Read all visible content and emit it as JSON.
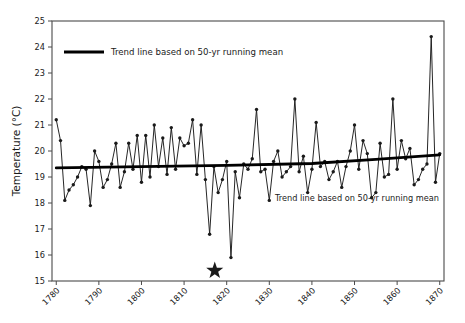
{
  "chart_data": {
    "type": "line",
    "title": "",
    "xlabel": "",
    "ylabel": "Temperature (°C)",
    "xlim": [
      1779,
      1871
    ],
    "ylim": [
      15,
      25
    ],
    "grid": false,
    "xticks": [
      1780,
      1790,
      1800,
      1810,
      1820,
      1830,
      1840,
      1850,
      1860,
      1870
    ],
    "xtick_labels": [
      "1780",
      "1790",
      "1800",
      "1810",
      "1820",
      "1830",
      "1840",
      "1850",
      "1860",
      "1870"
    ],
    "yticks": [
      15,
      16,
      17,
      18,
      19,
      20,
      21,
      22,
      23,
      24,
      25
    ],
    "ytick_labels": [
      "15",
      "16",
      "17",
      "18",
      "19",
      "20",
      "21",
      "22",
      "23",
      "24",
      "25"
    ],
    "legend": {
      "position": "top-left-inside",
      "entries": [
        {
          "label": "Trend line based on 50-yr running mean",
          "color": "#000000",
          "marker": "line"
        }
      ]
    },
    "annotations": [
      {
        "text": "Trend line based on 50-yr running mean",
        "x": 1838.5,
        "y": 18.35
      }
    ],
    "series": [
      {
        "name": "Annual temperature",
        "color": "#1a1a1a",
        "marker": "circle",
        "x": [
          1780,
          1781,
          1782,
          1783,
          1784,
          1785,
          1786,
          1787,
          1788,
          1789,
          1790,
          1791,
          1792,
          1793,
          1794,
          1795,
          1796,
          1797,
          1798,
          1799,
          1800,
          1801,
          1802,
          1803,
          1804,
          1805,
          1806,
          1807,
          1808,
          1809,
          1810,
          1811,
          1812,
          1813,
          1814,
          1815,
          1816,
          1817,
          1818,
          1819,
          1820,
          1821,
          1822,
          1823,
          1824,
          1825,
          1826,
          1827,
          1828,
          1829,
          1830,
          1831,
          1832,
          1833,
          1834,
          1835,
          1836,
          1837,
          1838,
          1839,
          1840,
          1841,
          1842,
          1843,
          1844,
          1845,
          1846,
          1847,
          1848,
          1849,
          1850,
          1851,
          1852,
          1853,
          1854,
          1855,
          1856,
          1857,
          1858,
          1859,
          1860,
          1861,
          1862,
          1863,
          1864,
          1865,
          1866,
          1867,
          1868,
          1869,
          1870
        ],
        "y": [
          21.2,
          20.4,
          18.1,
          18.5,
          18.7,
          19.0,
          19.4,
          19.3,
          17.9,
          20.0,
          19.6,
          18.6,
          18.9,
          19.5,
          20.3,
          18.6,
          19.2,
          20.3,
          19.3,
          20.6,
          18.8,
          20.6,
          19.0,
          21.0,
          19.4,
          20.5,
          19.1,
          20.9,
          19.3,
          20.5,
          20.2,
          20.3,
          21.2,
          19.1,
          21.0,
          18.9,
          16.8,
          19.4,
          18.4,
          18.9,
          19.6,
          15.9,
          19.2,
          18.2,
          19.5,
          19.3,
          19.7,
          21.6,
          19.2,
          19.3,
          18.1,
          19.6,
          20.0,
          19.0,
          19.2,
          19.4,
          22.0,
          19.2,
          19.8,
          18.4,
          19.3,
          21.1,
          19.4,
          19.6,
          18.9,
          19.2,
          19.6,
          18.6,
          19.4,
          20.0,
          21.0,
          19.3,
          20.4,
          19.9,
          18.2,
          18.4,
          20.3,
          19.0,
          19.1,
          22.0,
          19.3,
          20.4,
          19.7,
          20.1,
          18.7,
          18.9,
          19.3,
          19.5,
          24.4,
          18.8,
          19.9
        ]
      },
      {
        "name": "Trend line based on 50-yr running mean",
        "color": "#000000",
        "marker": "none",
        "x": [
          1780,
          1800,
          1820,
          1840,
          1855,
          1870
        ],
        "y": [
          19.35,
          19.4,
          19.45,
          19.52,
          19.68,
          19.85
        ]
      }
    ],
    "special_markers": [
      {
        "shape": "star",
        "x": 1817.2,
        "y": 15.4,
        "size": 9,
        "color": "#1a1a1a"
      }
    ]
  }
}
